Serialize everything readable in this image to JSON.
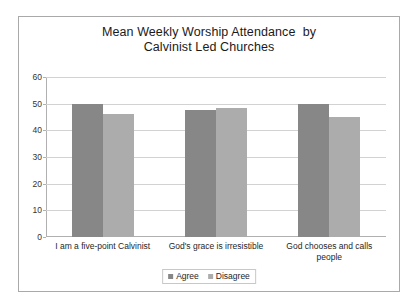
{
  "chart_data": {
    "type": "bar",
    "title_line1": "Mean Weekly Worship Attendance  by",
    "title_line2": "Calvinist Led Churches",
    "xlabel": "",
    "ylabel": "",
    "ylim": [
      0,
      60
    ],
    "yticks": [
      "0",
      "10",
      "20",
      "30",
      "40",
      "50",
      "60"
    ],
    "ytick_values": [
      0,
      10,
      20,
      30,
      40,
      50,
      60
    ],
    "grid": true,
    "legend_position": "bottom",
    "categories": [
      "I am a five-point Calvinist",
      "God's grace is irresistible",
      "God chooses and calls\npeople"
    ],
    "series": [
      {
        "name": "Agree",
        "color": "#878787",
        "values": [
          50,
          47.5,
          50
        ]
      },
      {
        "name": "Disagree",
        "color": "#acacac",
        "values": [
          46,
          48.5,
          45
        ]
      }
    ]
  },
  "legend": {
    "items": [
      {
        "label": "Agree"
      },
      {
        "label": "Disagree"
      }
    ]
  },
  "colors": {
    "agree": "#878787",
    "disagree": "#acacac",
    "gridline": "#d2d2d2",
    "border": "#a9a9a9",
    "background": "#ffffff"
  }
}
